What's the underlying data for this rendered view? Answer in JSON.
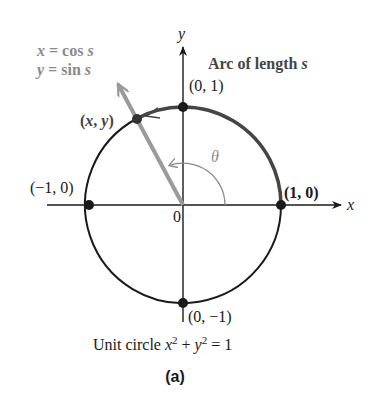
{
  "figure": {
    "equations": {
      "line1_var": "x",
      "line1_rest": " = cos ",
      "line1_param": "s",
      "line2_var": "y",
      "line2_rest": " = sin ",
      "line2_param": "s"
    },
    "arc_label": {
      "text": "Arc of length ",
      "param": "s"
    },
    "axes": {
      "x_label": "x",
      "y_label": "y",
      "origin_label": "0"
    },
    "points": {
      "top": "(0, 1)",
      "left": "(−1, 0)",
      "right": "(1, 0)",
      "bottom": "(0, −1)",
      "moving_open": "(",
      "moving_x": "x",
      "moving_comma": ", ",
      "moving_y": "y",
      "moving_close": ")"
    },
    "angle_label": "θ",
    "caption": {
      "prefix": "Unit circle ",
      "x": "x",
      "exp1": "2",
      "plus": " + ",
      "y": "y",
      "exp2": "2",
      "suffix": " = 1"
    },
    "sublabel": "(a)",
    "colors": {
      "axis": "#1a1a1a",
      "circle": "#1a1a1a",
      "arc_highlight": "#454545",
      "radius_line": "#9a9a9a",
      "angle_arc": "#8a8a8a",
      "gray_text": "#8a8a8a"
    },
    "geometry": {
      "center": [
        183,
        205
      ],
      "radius": 98,
      "point_angle_deg": 118,
      "angle_arc_radius": 42
    }
  }
}
